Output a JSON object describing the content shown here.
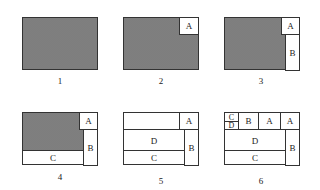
{
  "figure": {
    "panels": [
      {
        "number": "1",
        "regions": []
      },
      {
        "number": "2",
        "regions": [
          "A"
        ]
      },
      {
        "number": "3",
        "regions": [
          "A",
          "B"
        ]
      },
      {
        "number": "4",
        "regions": [
          "A",
          "B",
          "C"
        ]
      },
      {
        "number": "5",
        "regions": [
          "A",
          "B",
          "C",
          "D"
        ]
      },
      {
        "number": "6",
        "regions": [
          "C",
          "D",
          "B",
          "A",
          "A",
          "D",
          "C",
          "B"
        ]
      }
    ],
    "labels": {
      "A": "A",
      "B": "B",
      "C": "C",
      "D": "D"
    },
    "colors": {
      "border": "#333333",
      "shaded_fill": "#e8e8e8",
      "dot": "#777777"
    }
  }
}
